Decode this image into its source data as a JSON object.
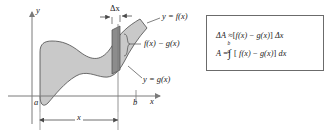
{
  "figure": {
    "type": "calculus-area-between-curves-diagram",
    "axes": {
      "y_axis_label": "y",
      "x_axis_label": "x",
      "y_axis_x_px": 32,
      "x_axis_y_px": 96
    },
    "curve_labels": {
      "upper": "y = f(x)",
      "lower": "y = g(x)",
      "strip_height": "f(x) − g(x)",
      "strip_width": "Δx"
    },
    "bounds": {
      "left_label": "a",
      "right_label": "b",
      "distance_label": "x"
    },
    "colors": {
      "region_fill": "#c9c9c9",
      "strip_fill": "#8c8c8c",
      "outline": "#4a4a4a",
      "axis": "#7a7a7a",
      "box_border": "#6b6b6b",
      "text": "#1a1a1a"
    }
  },
  "formula_box": {
    "line1": {
      "lhs": "ΔA",
      "rel": "≈",
      "rhs_open": "[",
      "f": "f(x)",
      "minus": "−",
      "g": "g(x)",
      "rhs_close": "]",
      "dx": "Δx"
    },
    "line2": {
      "lhs": "A",
      "rel": "=",
      "integral": "∫",
      "upper_limit": "b",
      "lower_limit": "a",
      "rhs_open": "[",
      "f": "f(x)",
      "minus": "−",
      "g": "g(x)",
      "rhs_close": "]",
      "dx": "dx"
    }
  }
}
